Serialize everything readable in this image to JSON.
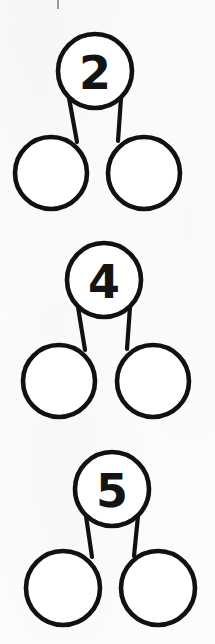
{
  "page": {
    "kind": "number-bond-worksheet",
    "background_color": "#fcfcfb",
    "ink_color": "#111111",
    "width": 215,
    "height": 644,
    "faint_show_through_text": "",
    "bleed_through_visible": true
  },
  "worksheet": {
    "title": "",
    "instructions": "",
    "bonds": [
      {
        "id": "bond-1",
        "whole": "2",
        "part_left": "",
        "part_right": "",
        "part_left_placeholder": "",
        "part_right_placeholder": "",
        "whole_cx": 95,
        "whole_cy": 71,
        "whole_r": 37,
        "left_cx": 51,
        "left_cy": 173,
        "left_r": 36,
        "right_cx": 144,
        "right_cy": 173,
        "right_r": 36,
        "cropped_bottom": false
      },
      {
        "id": "bond-2",
        "whole": "4",
        "part_left": "",
        "part_right": "",
        "part_left_placeholder": "",
        "part_right_placeholder": "",
        "whole_cx": 104,
        "whole_cy": 280,
        "whole_r": 37,
        "left_cx": 59,
        "left_cy": 381,
        "left_r": 36,
        "right_cx": 153,
        "right_cy": 381,
        "right_r": 36,
        "cropped_bottom": false
      },
      {
        "id": "bond-3",
        "whole": "5",
        "part_left": "",
        "part_right": "",
        "part_left_placeholder": "",
        "part_right_placeholder": "",
        "whole_cx": 112,
        "whole_cy": 489,
        "whole_r": 37,
        "left_cx": 63,
        "left_cy": 588,
        "left_r": 37,
        "right_cx": 158,
        "right_cy": 588,
        "right_r": 37,
        "cropped_bottom": true
      }
    ]
  }
}
